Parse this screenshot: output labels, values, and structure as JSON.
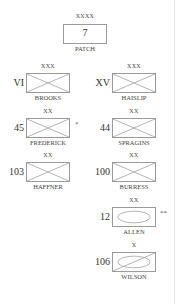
{
  "patch": {
    "top_label": "XXXX",
    "number": "7",
    "bottom_label": "PATCH"
  },
  "left_column": [
    {
      "name": "BROOKS",
      "number": "VI",
      "top_label": "XXX",
      "shape": "x-box",
      "mark": ""
    },
    {
      "name": "FREDERICK",
      "number": "45",
      "top_label": "XX",
      "shape": "x-box",
      "mark": "*"
    },
    {
      "name": "HAFFNER",
      "number": "103",
      "top_label": "XX",
      "shape": "x-box",
      "mark": ""
    }
  ],
  "right_column": [
    {
      "name": "HAISLIP",
      "number": "XV",
      "top_label": "XXX",
      "shape": "x-box",
      "mark": ""
    },
    {
      "name": "SPRAGINS",
      "number": "44",
      "top_label": "XX",
      "shape": "x-box",
      "mark": ""
    },
    {
      "name": "BURRESS",
      "number": "100",
      "top_label": "XX",
      "shape": "x-box",
      "mark": ""
    },
    {
      "name": "ALLEN",
      "number": "12",
      "top_label": "XX",
      "shape": "ellipse-box",
      "mark": "**"
    },
    {
      "name": "WILSON",
      "number": "106",
      "top_label": "X",
      "shape": "ellipse-slash-box",
      "mark": ""
    }
  ],
  "colors": {
    "line": "#9a9a9a",
    "text": "#333333",
    "background": "#ffffff"
  }
}
